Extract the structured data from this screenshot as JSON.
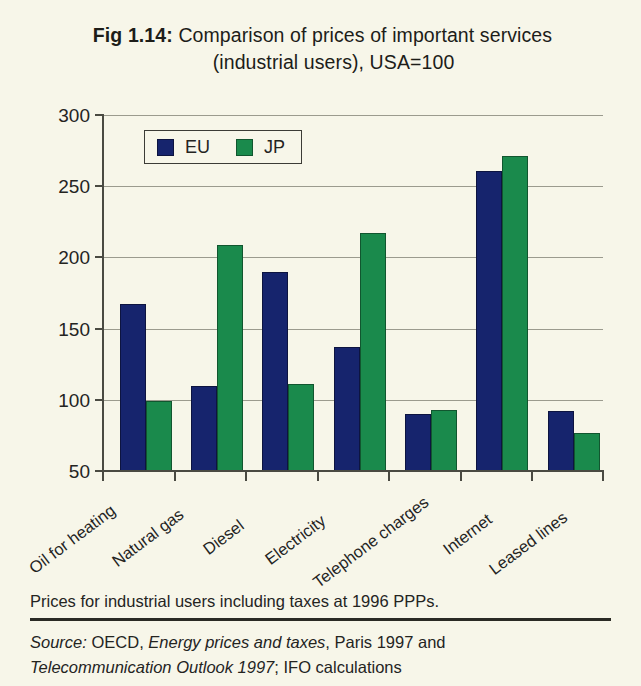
{
  "figure": {
    "number_label": "Fig 1.14:",
    "title_line1": "Comparison of prices of important services",
    "title_line2": "(industrial users), USA=100"
  },
  "legend": {
    "items": [
      {
        "key": "EU",
        "label": "EU",
        "color": "#16246d"
      },
      {
        "key": "JP",
        "label": "JP",
        "color": "#1a8a4c"
      }
    ]
  },
  "notes": {
    "footnote": "Prices for industrial users including taxes at 1996 PPPs.",
    "source_prefix": "Source:",
    "source_part1": " OECD, ",
    "source_italic1": "Energy prices and taxes",
    "source_part2": ", Paris 1997 and",
    "source_italic2": "Telecommunication Outlook 1997",
    "source_part3": "; IFO calculations"
  },
  "chart_data": {
    "type": "bar",
    "title": "Fig 1.14: Comparison of prices of important services (industrial users), USA=100",
    "xlabel": "",
    "ylabel": "",
    "ylim": [
      50,
      300
    ],
    "yticks": [
      50,
      100,
      150,
      200,
      250,
      300
    ],
    "ytick_labels": [
      "50",
      "100",
      "150",
      "200",
      "250",
      "300"
    ],
    "grid": true,
    "legend_position": "top-left inside",
    "categories": [
      "Oil for heating",
      "Natural gas",
      "Diesel",
      "Electricity",
      "Telephone charges",
      "Internet",
      "Leased lines"
    ],
    "series": [
      {
        "name": "EU",
        "color": "#16246d",
        "values": [
          167,
          110,
          190,
          137,
          90,
          261,
          92
        ]
      },
      {
        "name": "JP",
        "color": "#1a8a4c",
        "values": [
          99,
          209,
          111,
          217,
          93,
          271,
          77
        ]
      }
    ]
  }
}
